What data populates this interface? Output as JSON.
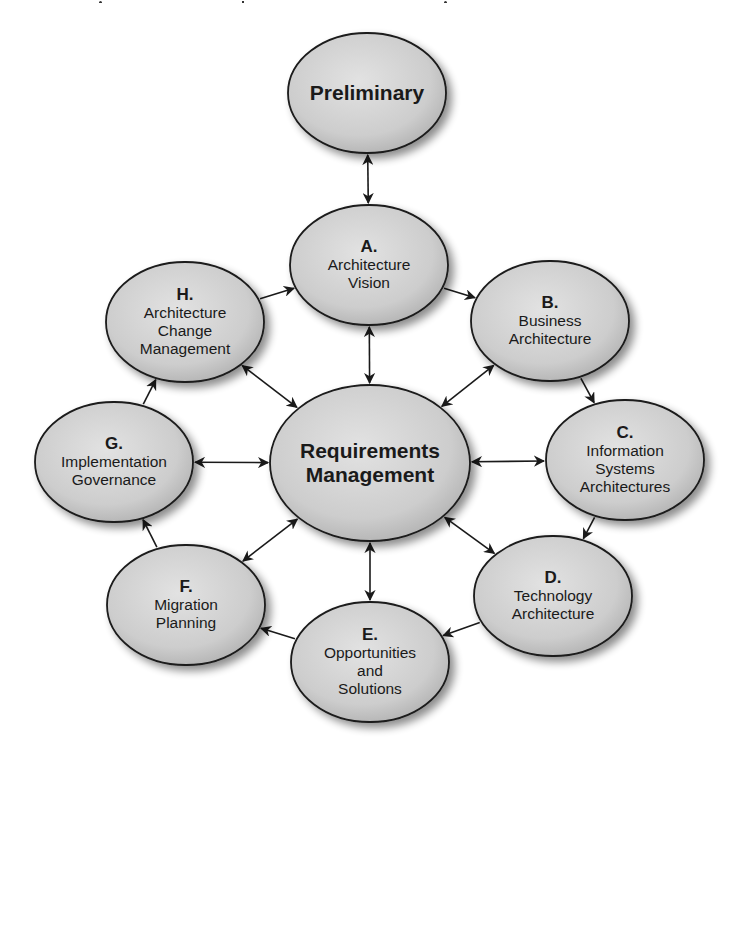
{
  "diagram": {
    "colors": {
      "node_fill_light": "#dcdcdc",
      "node_fill_dark": "#b4b4b4",
      "node_stroke": "#1a1a1a",
      "arrow": "#1a1a1a",
      "background": "#ffffff",
      "text": "#1a1a1a"
    },
    "nodes": [
      {
        "id": "preliminary",
        "letter": "",
        "lines": [
          "Preliminary"
        ],
        "bold": true,
        "cx": 367,
        "cy": 93,
        "rx": 79,
        "ry": 60
      },
      {
        "id": "a",
        "letter": "A.",
        "lines": [
          "Architecture",
          "Vision"
        ],
        "bold": false,
        "cx": 369,
        "cy": 265,
        "rx": 79,
        "ry": 60
      },
      {
        "id": "b",
        "letter": "B.",
        "lines": [
          "Business",
          "Architecture"
        ],
        "bold": false,
        "cx": 550,
        "cy": 321,
        "rx": 79,
        "ry": 60
      },
      {
        "id": "c",
        "letter": "C.",
        "lines": [
          "Information",
          "Systems",
          "Architectures"
        ],
        "bold": false,
        "cx": 625,
        "cy": 460,
        "rx": 79,
        "ry": 60
      },
      {
        "id": "d",
        "letter": "D.",
        "lines": [
          "Technology",
          "Architecture"
        ],
        "bold": false,
        "cx": 553,
        "cy": 596,
        "rx": 79,
        "ry": 60
      },
      {
        "id": "e",
        "letter": "E.",
        "lines": [
          "Opportunities",
          "and",
          "Solutions"
        ],
        "bold": false,
        "cx": 370,
        "cy": 662,
        "rx": 79,
        "ry": 60
      },
      {
        "id": "f",
        "letter": "F.",
        "lines": [
          "Migration",
          "Planning"
        ],
        "bold": false,
        "cx": 186,
        "cy": 605,
        "rx": 79,
        "ry": 60
      },
      {
        "id": "g",
        "letter": "G.",
        "lines": [
          "Implementation",
          "Governance"
        ],
        "bold": false,
        "cx": 114,
        "cy": 462,
        "rx": 79,
        "ry": 60
      },
      {
        "id": "h",
        "letter": "H.",
        "lines": [
          "Architecture",
          "Change",
          "Management"
        ],
        "bold": false,
        "cx": 185,
        "cy": 322,
        "rx": 79,
        "ry": 60
      },
      {
        "id": "requirements",
        "letter": "",
        "lines": [
          "Requirements",
          "Management"
        ],
        "bold": true,
        "cx": 370,
        "cy": 463,
        "rx": 100,
        "ry": 78
      }
    ],
    "edges": [
      {
        "from": "preliminary",
        "to": "a",
        "bidirectional": true
      },
      {
        "from": "a",
        "to": "b",
        "bidirectional": false
      },
      {
        "from": "b",
        "to": "c",
        "bidirectional": false
      },
      {
        "from": "c",
        "to": "d",
        "bidirectional": false
      },
      {
        "from": "d",
        "to": "e",
        "bidirectional": false
      },
      {
        "from": "e",
        "to": "f",
        "bidirectional": false
      },
      {
        "from": "f",
        "to": "g",
        "bidirectional": false
      },
      {
        "from": "g",
        "to": "h",
        "bidirectional": false
      },
      {
        "from": "h",
        "to": "a",
        "bidirectional": false
      },
      {
        "from": "requirements",
        "to": "a",
        "bidirectional": true
      },
      {
        "from": "requirements",
        "to": "b",
        "bidirectional": true
      },
      {
        "from": "requirements",
        "to": "c",
        "bidirectional": true
      },
      {
        "from": "requirements",
        "to": "d",
        "bidirectional": true
      },
      {
        "from": "requirements",
        "to": "e",
        "bidirectional": true
      },
      {
        "from": "requirements",
        "to": "f",
        "bidirectional": true
      },
      {
        "from": "requirements",
        "to": "g",
        "bidirectional": true
      },
      {
        "from": "requirements",
        "to": "h",
        "bidirectional": true
      }
    ]
  }
}
